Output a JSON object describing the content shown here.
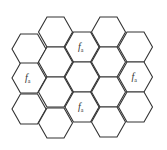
{
  "diagram": {
    "type": "hexagonal-cell-grid",
    "orientation": "flat-top",
    "stroke_color": "#333333",
    "hex_width": 34,
    "hex_height": 30,
    "columns": [
      {
        "left": 12,
        "tops": [
          34,
          63,
          94
        ],
        "labels": [
          "",
          "f_a",
          ""
        ]
      },
      {
        "left": 38.5,
        "tops": [
          17,
          47,
          77,
          108
        ],
        "labels": [
          "",
          "",
          "",
          ""
        ]
      },
      {
        "left": 65,
        "tops": [
          32,
          62,
          92
        ],
        "labels": [
          "f_a",
          "",
          "f_a"
        ]
      },
      {
        "left": 91.5,
        "tops": [
          17,
          47,
          77,
          107
        ],
        "labels": [
          "",
          "",
          "",
          ""
        ]
      },
      {
        "left": 118.5,
        "tops": [
          32,
          62,
          92
        ],
        "labels": [
          "",
          "f_a",
          ""
        ]
      }
    ],
    "label_base": "f",
    "label_subscript": "a"
  }
}
